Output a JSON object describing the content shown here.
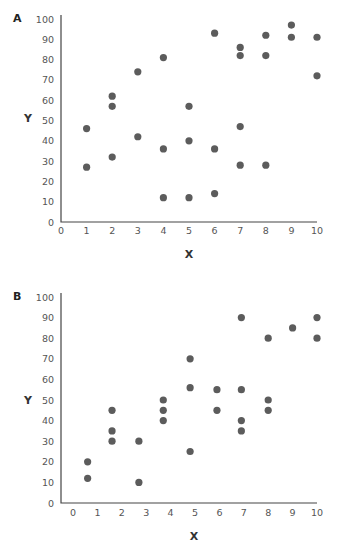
{
  "chart_data": [
    {
      "type": "scatter",
      "panel_label": "A",
      "xlabel": "X",
      "ylabel": "Y",
      "xlim": [
        0,
        10
      ],
      "ylim": [
        0,
        100
      ],
      "xticks": [
        0,
        1,
        2,
        3,
        4,
        5,
        6,
        7,
        8,
        9,
        10
      ],
      "yticks": [
        0,
        10,
        20,
        30,
        40,
        50,
        60,
        70,
        80,
        90,
        100
      ],
      "grid": false,
      "points": [
        {
          "x": 1,
          "y": 46
        },
        {
          "x": 1,
          "y": 27
        },
        {
          "x": 2,
          "y": 62
        },
        {
          "x": 2,
          "y": 57
        },
        {
          "x": 2,
          "y": 32
        },
        {
          "x": 3,
          "y": 74
        },
        {
          "x": 3,
          "y": 42
        },
        {
          "x": 4,
          "y": 81
        },
        {
          "x": 4,
          "y": 36
        },
        {
          "x": 4,
          "y": 12
        },
        {
          "x": 5,
          "y": 57
        },
        {
          "x": 5,
          "y": 40
        },
        {
          "x": 5,
          "y": 12
        },
        {
          "x": 6,
          "y": 93
        },
        {
          "x": 6,
          "y": 36
        },
        {
          "x": 6,
          "y": 14
        },
        {
          "x": 7,
          "y": 86
        },
        {
          "x": 7,
          "y": 82
        },
        {
          "x": 7,
          "y": 47
        },
        {
          "x": 7,
          "y": 28
        },
        {
          "x": 8,
          "y": 92
        },
        {
          "x": 8,
          "y": 82
        },
        {
          "x": 8,
          "y": 28
        },
        {
          "x": 9,
          "y": 97
        },
        {
          "x": 9,
          "y": 91
        },
        {
          "x": 10,
          "y": 91
        },
        {
          "x": 10,
          "y": 72
        }
      ]
    },
    {
      "type": "scatter",
      "panel_label": "B",
      "xlabel": "X",
      "ylabel": "Y",
      "xlim": [
        0,
        10
      ],
      "ylim": [
        0,
        100
      ],
      "xticks": [
        0,
        1,
        2,
        3,
        4,
        5,
        6,
        7,
        8,
        9,
        10
      ],
      "yticks": [
        0,
        10,
        20,
        30,
        40,
        50,
        60,
        70,
        80,
        90,
        100
      ],
      "grid": false,
      "points": [
        {
          "x": 0.6,
          "y": 20
        },
        {
          "x": 0.6,
          "y": 12
        },
        {
          "x": 1.6,
          "y": 45
        },
        {
          "x": 1.6,
          "y": 35
        },
        {
          "x": 1.6,
          "y": 30
        },
        {
          "x": 2.7,
          "y": 30
        },
        {
          "x": 2.7,
          "y": 10
        },
        {
          "x": 3.7,
          "y": 50
        },
        {
          "x": 3.7,
          "y": 45
        },
        {
          "x": 3.7,
          "y": 40
        },
        {
          "x": 4.8,
          "y": 70
        },
        {
          "x": 4.8,
          "y": 56
        },
        {
          "x": 4.8,
          "y": 25
        },
        {
          "x": 5.9,
          "y": 55
        },
        {
          "x": 5.9,
          "y": 45
        },
        {
          "x": 6.9,
          "y": 90
        },
        {
          "x": 6.9,
          "y": 55
        },
        {
          "x": 6.9,
          "y": 40
        },
        {
          "x": 6.9,
          "y": 35
        },
        {
          "x": 8,
          "y": 80
        },
        {
          "x": 8,
          "y": 50
        },
        {
          "x": 8,
          "y": 45
        },
        {
          "x": 9,
          "y": 85
        },
        {
          "x": 10,
          "y": 90
        },
        {
          "x": 10,
          "y": 80
        }
      ]
    }
  ]
}
